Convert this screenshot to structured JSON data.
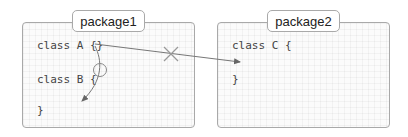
{
  "packages": [
    {
      "name": "package1",
      "code_lines": [
        "class A {}",
        "class B {",
        "}"
      ]
    },
    {
      "name": "package2",
      "code_lines": [
        "class C {",
        "}"
      ]
    }
  ],
  "connections": [
    {
      "from": "class A",
      "to": "class C",
      "status": "forbidden",
      "marker": "cross"
    },
    {
      "from": "class A",
      "to": "class B",
      "status": "allowed",
      "marker": "circle"
    }
  ],
  "colors": {
    "border": "#a9a9a9",
    "line": "#666666",
    "text": "#444444"
  }
}
